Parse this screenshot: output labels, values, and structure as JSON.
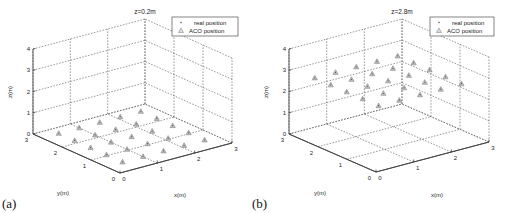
{
  "chart_data": [
    {
      "panel_label": "(a)",
      "type": "scatter3d",
      "title": "z=0.2m",
      "xlabel": "x(m)",
      "ylabel": "y(m)",
      "zlabel": "z(m)",
      "xlim": [
        0,
        3
      ],
      "ylim": [
        0,
        3
      ],
      "zlim": [
        0,
        4
      ],
      "xticks": [
        "0",
        "1",
        "2",
        "3"
      ],
      "yticks": [
        "0",
        "1",
        "2",
        "3"
      ],
      "zticks": [
        "0",
        "1",
        "2",
        "3",
        "4"
      ],
      "grid": true,
      "legend": {
        "position": "upper right",
        "entries": [
          "real position",
          "ACO position"
        ]
      },
      "series": [
        {
          "name": "ACO position",
          "marker": "triangle",
          "z": 0.2,
          "points": [
            [
              0.3,
              0.3
            ],
            [
              0.3,
              0.85
            ],
            [
              0.3,
              1.4
            ],
            [
              0.3,
              1.95
            ],
            [
              0.3,
              2.5
            ],
            [
              0.85,
              0.3
            ],
            [
              0.85,
              0.85
            ],
            [
              0.85,
              1.4
            ],
            [
              0.85,
              1.95
            ],
            [
              0.85,
              2.5
            ],
            [
              1.4,
              0.3
            ],
            [
              1.4,
              0.85
            ],
            [
              1.4,
              1.4
            ],
            [
              1.4,
              1.95
            ],
            [
              1.4,
              2.5
            ],
            [
              1.95,
              0.3
            ],
            [
              1.95,
              0.85
            ],
            [
              1.95,
              1.4
            ],
            [
              1.95,
              1.95
            ],
            [
              1.95,
              2.5
            ],
            [
              2.5,
              0.3
            ],
            [
              2.5,
              0.85
            ],
            [
              2.5,
              1.4
            ],
            [
              2.5,
              1.95
            ],
            [
              2.5,
              2.5
            ]
          ]
        },
        {
          "name": "real position",
          "marker": "dot",
          "z": 0.2,
          "points": [
            [
              0.3,
              0.3
            ],
            [
              0.3,
              0.85
            ],
            [
              0.3,
              1.4
            ],
            [
              0.3,
              1.95
            ],
            [
              0.3,
              2.5
            ],
            [
              0.85,
              0.3
            ],
            [
              0.85,
              0.85
            ],
            [
              0.85,
              1.4
            ],
            [
              0.85,
              1.95
            ],
            [
              0.85,
              2.5
            ],
            [
              1.4,
              0.3
            ],
            [
              1.4,
              0.85
            ],
            [
              1.4,
              1.4
            ],
            [
              1.4,
              1.95
            ],
            [
              1.4,
              2.5
            ],
            [
              1.95,
              0.3
            ],
            [
              1.95,
              0.85
            ],
            [
              1.95,
              1.4
            ],
            [
              1.95,
              1.95
            ],
            [
              1.95,
              2.5
            ],
            [
              2.5,
              0.3
            ],
            [
              2.5,
              0.85
            ],
            [
              2.5,
              1.4
            ],
            [
              2.5,
              1.95
            ],
            [
              2.5,
              2.5
            ]
          ]
        }
      ]
    },
    {
      "panel_label": "(b)",
      "type": "scatter3d",
      "title": "z=2.8m",
      "xlabel": "x(m)",
      "ylabel": "y(m)",
      "zlabel": "z(m)",
      "xlim": [
        0,
        3
      ],
      "ylim": [
        0,
        3
      ],
      "zlim": [
        0,
        4
      ],
      "xticks": [
        "0",
        "1",
        "2",
        "3"
      ],
      "yticks": [
        "0",
        "1",
        "2",
        "3"
      ],
      "zticks": [
        "0",
        "1",
        "2",
        "3",
        "4"
      ],
      "grid": true,
      "legend": {
        "position": "upper right",
        "entries": [
          "real position",
          "ACO position"
        ]
      },
      "series": [
        {
          "name": "ACO position",
          "marker": "triangle",
          "z": 2.8,
          "points": [
            [
              0.3,
              0.3
            ],
            [
              0.3,
              0.85
            ],
            [
              0.3,
              1.4
            ],
            [
              0.3,
              1.95
            ],
            [
              0.3,
              2.5
            ],
            [
              0.85,
              0.3
            ],
            [
              0.85,
              0.85
            ],
            [
              0.85,
              1.4
            ],
            [
              0.85,
              1.95
            ],
            [
              0.85,
              2.5
            ],
            [
              1.4,
              0.3
            ],
            [
              1.4,
              0.85
            ],
            [
              1.4,
              1.4
            ],
            [
              1.4,
              1.95
            ],
            [
              1.4,
              2.5
            ],
            [
              1.95,
              0.3
            ],
            [
              1.95,
              0.85
            ],
            [
              1.95,
              1.4
            ],
            [
              1.95,
              1.95
            ],
            [
              1.95,
              2.5
            ],
            [
              2.5,
              0.3
            ],
            [
              2.5,
              0.85
            ],
            [
              2.5,
              1.4
            ],
            [
              2.5,
              1.95
            ],
            [
              2.5,
              2.5
            ]
          ]
        },
        {
          "name": "real position",
          "marker": "dot",
          "z": 2.8,
          "points": [
            [
              0.3,
              0.3
            ],
            [
              0.3,
              0.85
            ],
            [
              0.3,
              1.4
            ],
            [
              0.3,
              1.95
            ],
            [
              0.3,
              2.5
            ],
            [
              0.85,
              0.3
            ],
            [
              0.85,
              0.85
            ],
            [
              0.85,
              1.4
            ],
            [
              0.85,
              1.95
            ],
            [
              0.85,
              2.5
            ],
            [
              1.4,
              0.3
            ],
            [
              1.4,
              0.85
            ],
            [
              1.4,
              1.4
            ],
            [
              1.4,
              1.95
            ],
            [
              1.4,
              2.5
            ],
            [
              1.95,
              0.3
            ],
            [
              1.95,
              0.85
            ],
            [
              1.95,
              1.4
            ],
            [
              1.95,
              1.95
            ],
            [
              1.95,
              2.5
            ],
            [
              2.5,
              0.3
            ],
            [
              2.5,
              0.85
            ],
            [
              2.5,
              1.4
            ],
            [
              2.5,
              1.95
            ],
            [
              2.5,
              2.5
            ]
          ]
        }
      ]
    }
  ],
  "panels": [
    {
      "label": "(a)",
      "title": "z=0.2m",
      "legend": {
        "real": "real position",
        "aco": "ACO position"
      },
      "axes": {
        "x": "x(m)",
        "y": "y(m)",
        "z": "z(m)"
      }
    },
    {
      "label": "(b)",
      "title": "z=2.8m",
      "legend": {
        "real": "real position",
        "aco": "ACO position"
      },
      "axes": {
        "x": "x(m)",
        "y": "y(m)",
        "z": "z(m)"
      }
    }
  ],
  "style": {
    "axis_color": "#444444",
    "grid_color": "#555555",
    "marker_color": "#888888"
  }
}
